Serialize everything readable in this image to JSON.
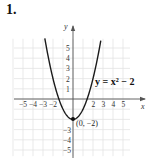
{
  "problem": {
    "number": "1."
  },
  "chart_data": {
    "type": "line",
    "title": "",
    "function": "y = x^2 - 2",
    "equation_label": "y = x² − 2",
    "xlabel": "x",
    "ylabel": "y",
    "xlim": [
      -6,
      6
    ],
    "ylim": [
      -6,
      6
    ],
    "grid": true,
    "x_ticks": [
      -5,
      -4,
      -3,
      -2,
      2,
      3,
      4,
      5
    ],
    "x_tick_labels": [
      "−5",
      "−4",
      "−3",
      "−2",
      "2",
      "3",
      "4",
      "5"
    ],
    "y_ticks": [
      5,
      4,
      3,
      2,
      1,
      -3,
      -4,
      -5
    ],
    "y_tick_labels": [
      "5",
      "4",
      "3",
      "2",
      "1",
      "−3",
      "−4",
      "−5"
    ],
    "series": [
      {
        "name": "y = x^2 - 2",
        "x": [
          -2.8,
          -2.5,
          -2,
          -1.5,
          -1,
          -0.5,
          0,
          0.5,
          1,
          1.5,
          2,
          2.5,
          2.8
        ],
        "y": [
          5.84,
          4.25,
          2,
          0.25,
          -1,
          -1.75,
          -2,
          -1.75,
          -1,
          0.25,
          2,
          4.25,
          5.84
        ]
      }
    ],
    "annotations": [
      {
        "text": "(0, −2)",
        "x": 0,
        "y": -2,
        "type": "vertex-point"
      }
    ]
  }
}
